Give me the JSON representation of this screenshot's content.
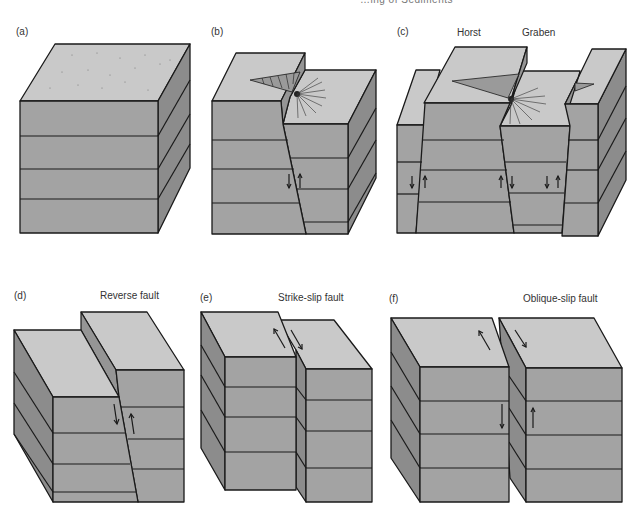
{
  "header": {
    "cropped_running_title": "…ing of Sediments"
  },
  "panels": [
    {
      "id": "a",
      "label": "(a)",
      "title": ""
    },
    {
      "id": "b",
      "label": "(b)",
      "title": ""
    },
    {
      "id": "c",
      "label": "(c)",
      "title": "",
      "annotations": [
        "Horst",
        "Graben"
      ]
    },
    {
      "id": "d",
      "label": "(d)",
      "title": "Reverse fault"
    },
    {
      "id": "e",
      "label": "(e)",
      "title": "Strike-slip fault"
    },
    {
      "id": "f",
      "label": "(f)",
      "title": "Oblique-slip fault"
    }
  ],
  "colors": {
    "top_face": "#c9c9c9",
    "front_face": "#a3a3a3",
    "side_face": "#8c8c8c",
    "outline": "#1a1a1a"
  }
}
